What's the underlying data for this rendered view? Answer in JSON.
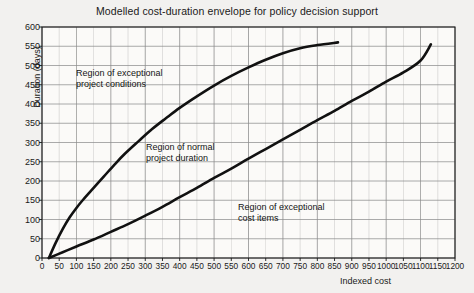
{
  "chart_data": {
    "type": "line",
    "title": "Modelled cost-duration envelope for policy decision support",
    "xlabel": "Indexed cost",
    "ylabel": "Duration (days)",
    "xlim": [
      0,
      1200
    ],
    "ylim": [
      0,
      600
    ],
    "xticks": [
      0,
      50,
      100,
      150,
      200,
      250,
      300,
      350,
      400,
      450,
      500,
      550,
      600,
      650,
      700,
      750,
      800,
      850,
      900,
      950,
      1000,
      1050,
      1100,
      1150,
      1200
    ],
    "yticks": [
      0,
      50,
      100,
      150,
      200,
      250,
      300,
      350,
      400,
      450,
      500,
      550,
      600
    ],
    "grid": true,
    "grid_x_step": 50,
    "grid_y_step": 50,
    "legend": "none",
    "series": [
      {
        "name": "upper-envelope",
        "points": [
          [
            20,
            0
          ],
          [
            40,
            40
          ],
          [
            60,
            75
          ],
          [
            80,
            105
          ],
          [
            100,
            130
          ],
          [
            120,
            152
          ],
          [
            150,
            182
          ],
          [
            180,
            212
          ],
          [
            210,
            242
          ],
          [
            240,
            270
          ],
          [
            280,
            303
          ],
          [
            320,
            335
          ],
          [
            360,
            363
          ],
          [
            400,
            390
          ],
          [
            450,
            420
          ],
          [
            500,
            448
          ],
          [
            550,
            473
          ],
          [
            600,
            495
          ],
          [
            650,
            515
          ],
          [
            700,
            532
          ],
          [
            750,
            545
          ],
          [
            800,
            553
          ],
          [
            860,
            560
          ]
        ]
      },
      {
        "name": "lower-envelope",
        "points": [
          [
            20,
            0
          ],
          [
            60,
            15
          ],
          [
            100,
            30
          ],
          [
            150,
            48
          ],
          [
            200,
            68
          ],
          [
            250,
            88
          ],
          [
            300,
            110
          ],
          [
            350,
            133
          ],
          [
            400,
            158
          ],
          [
            450,
            182
          ],
          [
            500,
            208
          ],
          [
            550,
            232
          ],
          [
            600,
            258
          ],
          [
            650,
            283
          ],
          [
            700,
            308
          ],
          [
            750,
            333
          ],
          [
            800,
            358
          ],
          [
            850,
            382
          ],
          [
            900,
            408
          ],
          [
            950,
            432
          ],
          [
            1000,
            458
          ],
          [
            1050,
            482
          ],
          [
            1100,
            513
          ],
          [
            1130,
            555
          ]
        ]
      }
    ],
    "annotations": [
      {
        "text_line1": "Region of exceptional",
        "text_line2": "project conditions"
      },
      {
        "text_line1": "Region of normal",
        "text_line2": "project duration"
      },
      {
        "text_line1": "Region of exceptional",
        "text_line2": "cost items"
      }
    ],
    "colors": {
      "background": "#f2f1ef",
      "grid": "#8c8c8c",
      "axis": "#1a1a1a",
      "curve": "#111111",
      "text": "#1a1a1a"
    }
  }
}
